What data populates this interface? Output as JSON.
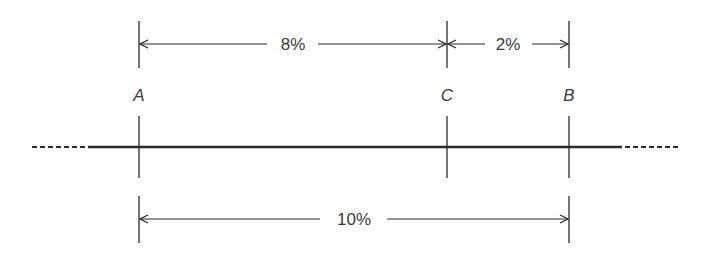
{
  "diagram": {
    "type": "number-line-dimension",
    "points": [
      {
        "id": "A",
        "label": "A",
        "x": 139
      },
      {
        "id": "C",
        "label": "C",
        "x": 447
      },
      {
        "id": "B",
        "label": "B",
        "x": 569
      }
    ],
    "dimensions": [
      {
        "from": "A",
        "to": "C",
        "label": "8%",
        "position": "top"
      },
      {
        "from": "C",
        "to": "B",
        "label": "2%",
        "position": "top"
      },
      {
        "from": "A",
        "to": "B",
        "label": "10%",
        "position": "bottom"
      }
    ],
    "line": {
      "style": "solid with dashed extensions both ends"
    },
    "colors": {
      "line": "#2a2a2a",
      "text": "#3a3a3a",
      "background": "#ffffff"
    }
  }
}
